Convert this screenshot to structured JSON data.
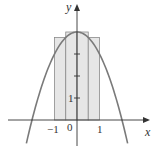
{
  "chart_data": {
    "type": "area",
    "title": "",
    "function": "y = 4 - x^2",
    "xlabel": "x",
    "ylabel": "y",
    "xlim": [
      -2.7,
      3.1
    ],
    "ylim": [
      -1.0,
      4.6
    ],
    "grid": false,
    "x_tick_labels": [
      "-1",
      "0",
      "1"
    ],
    "y_tick_labels": [
      "1"
    ],
    "y_ticks": [
      1,
      2,
      3
    ],
    "rectangles": {
      "description": "Upper (right/left max) Riemann rectangles on [-1, 1], n = 4",
      "x_left": [
        -1.0,
        -0.5,
        0.0,
        0.5
      ],
      "width": 0.5,
      "heights": [
        3.75,
        4.0,
        4.0,
        3.75
      ],
      "fill": "#e6e6e6",
      "stroke": "#888888"
    },
    "curve": {
      "x": [
        -2.2,
        -2,
        -1.5,
        -1,
        -0.5,
        0,
        0.5,
        1,
        1.5,
        2,
        2.2
      ],
      "y": [
        -0.84,
        0,
        1.75,
        3,
        3.75,
        4,
        3.75,
        3,
        1.75,
        0,
        -0.84
      ],
      "color": "#777777"
    },
    "colors": {
      "axis": "#333333",
      "curve": "#7a7a7a",
      "rect_fill": "#e6e6e6",
      "rect_stroke": "#8a8a8a"
    }
  },
  "labels": {
    "x_axis": "x",
    "y_axis": "y",
    "tick_neg1": "−1",
    "tick_0": "0",
    "tick_1_x": "1",
    "tick_1_y": "1"
  }
}
